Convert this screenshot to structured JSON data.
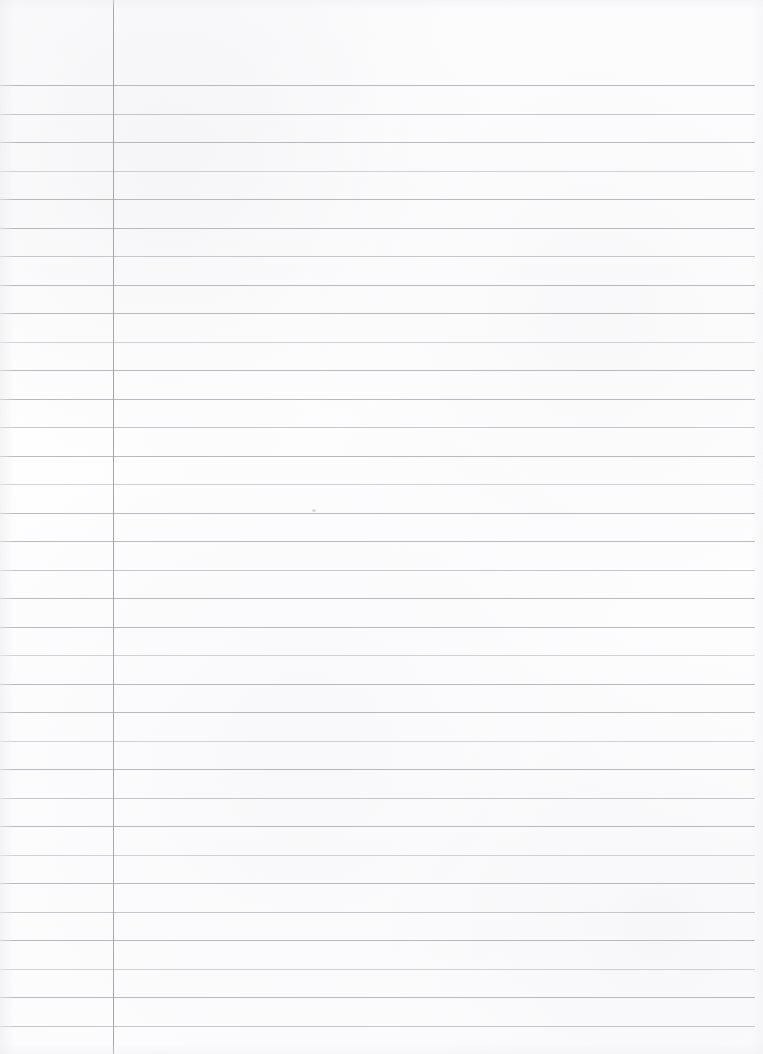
{
  "page": {
    "kind": "ruled-notebook-paper",
    "width": 763,
    "height": 1054,
    "background_color": "#fdfdfd",
    "content_text": "",
    "is_blank": true
  },
  "header_zone": {
    "label": "",
    "top": 0,
    "height": 85
  },
  "margin_rule": {
    "label": "",
    "x": 113,
    "color": "#9a9ca3",
    "thickness": 1
  },
  "ruling": {
    "label": "",
    "color": "#a9abb1",
    "thickness": 1,
    "spacing": 28.5,
    "first_line_y": 85,
    "line_start_x": 0,
    "line_end_x": 755,
    "count": 35,
    "line_y_positions": [
      85,
      113.5,
      142,
      170.5,
      199,
      227.5,
      256,
      284.5,
      313,
      341.5,
      370,
      398.5,
      427,
      455.5,
      484,
      512.5,
      541,
      569.5,
      598,
      626.5,
      655,
      683.5,
      712,
      740.5,
      769,
      797.5,
      826,
      854.5,
      883,
      911.5,
      940,
      968.5,
      997,
      1025.5,
      1054
    ],
    "faded_indices": [
      3,
      9,
      14,
      20,
      23,
      27,
      31
    ],
    "soft_indices": [
      1,
      6,
      12,
      17,
      25,
      29,
      33
    ]
  },
  "speck": {
    "label": "",
    "x": 312,
    "y": 509
  }
}
